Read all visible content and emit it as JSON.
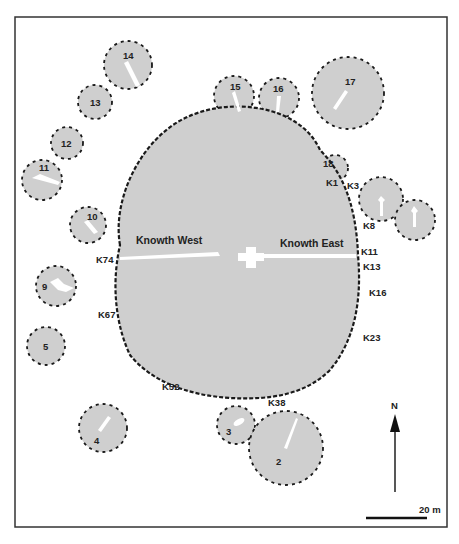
{
  "figure": {
    "colors": {
      "mound_fill": "#cfcfcf",
      "kerb_stroke": "#1a1a1a",
      "passage_fill": "#ffffff",
      "frame": "#333333"
    },
    "main_mound": {
      "passages": {
        "west_label": "Knowth West",
        "east_label": "Knowth East"
      },
      "kerbstones": [
        "K1",
        "K3",
        "K8",
        "K11",
        "K13",
        "K16",
        "K23",
        "K38",
        "K52",
        "K67",
        "K74"
      ]
    },
    "satellite_tombs": [
      "2",
      "3",
      "4",
      "5",
      "6",
      "8",
      "9",
      "10",
      "11",
      "12",
      "13",
      "14",
      "15",
      "16",
      "17",
      "18"
    ],
    "north_arrow": {
      "label": "N"
    },
    "scale_bar": {
      "label": "20 m"
    }
  }
}
